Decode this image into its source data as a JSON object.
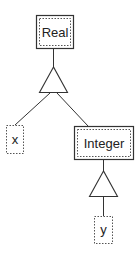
{
  "diagram": {
    "title": "",
    "nodes": [
      {
        "id": "real",
        "label": "Real",
        "style": "double-box"
      },
      {
        "id": "x",
        "label": "x",
        "style": "dotted-box"
      },
      {
        "id": "integer",
        "label": "Integer",
        "style": "double-box"
      },
      {
        "id": "y",
        "label": "y",
        "style": "dotted-box"
      }
    ],
    "connectors": [
      {
        "id": "tri1",
        "shape": "triangle",
        "parent": "real",
        "children": [
          "x",
          "integer"
        ]
      },
      {
        "id": "tri2",
        "shape": "triangle",
        "parent": "integer",
        "children": [
          "y"
        ]
      }
    ],
    "colors": {
      "stroke": "#333333",
      "text": "#222222",
      "background": "#ffffff"
    }
  }
}
